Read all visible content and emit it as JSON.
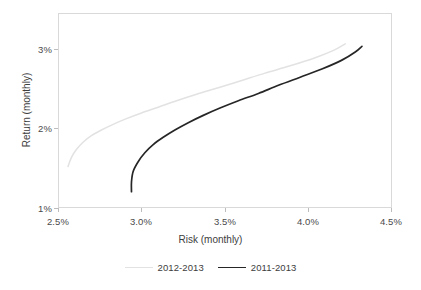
{
  "chart_data": {
    "type": "line",
    "title": "",
    "xlabel": "Risk (monthly)",
    "ylabel": "Return (monthly)",
    "xlim": [
      2.5,
      4.5
    ],
    "ylim": [
      1.0,
      3.4
    ],
    "xticks": [
      "2.5%",
      "3.0%",
      "3.5%",
      "4.0%",
      "4.5%"
    ],
    "xtick_values": [
      2.5,
      3.0,
      3.5,
      4.0,
      4.5
    ],
    "yticks": [
      "1%",
      "2%",
      "3%"
    ],
    "ytick_values": [
      1,
      2,
      3
    ],
    "grid": false,
    "legend_position": "bottom",
    "series": [
      {
        "name": "2012-2013",
        "color": "#e2e2e2",
        "points": [
          [
            2.56,
            1.51
          ],
          [
            2.58,
            1.62
          ],
          [
            2.61,
            1.72
          ],
          [
            2.65,
            1.81
          ],
          [
            2.7,
            1.89
          ],
          [
            2.76,
            1.96
          ],
          [
            2.83,
            2.03
          ],
          [
            2.91,
            2.1
          ],
          [
            3.0,
            2.17
          ],
          [
            3.1,
            2.24
          ],
          [
            3.21,
            2.32
          ],
          [
            3.33,
            2.4
          ],
          [
            3.46,
            2.48
          ],
          [
            3.6,
            2.57
          ],
          [
            3.74,
            2.66
          ],
          [
            3.89,
            2.75
          ],
          [
            4.04,
            2.85
          ],
          [
            4.15,
            2.94
          ],
          [
            4.22,
            3.02
          ]
        ]
      },
      {
        "name": "2011-2013",
        "color": "#262626",
        "points": [
          [
            2.94,
            1.2
          ],
          [
            2.94,
            1.32
          ],
          [
            2.95,
            1.45
          ],
          [
            2.98,
            1.57
          ],
          [
            3.02,
            1.68
          ],
          [
            3.07,
            1.78
          ],
          [
            3.13,
            1.87
          ],
          [
            3.2,
            1.96
          ],
          [
            3.28,
            2.05
          ],
          [
            3.37,
            2.14
          ],
          [
            3.47,
            2.23
          ],
          [
            3.58,
            2.32
          ],
          [
            3.7,
            2.41
          ],
          [
            3.82,
            2.51
          ],
          [
            3.95,
            2.61
          ],
          [
            4.08,
            2.71
          ],
          [
            4.2,
            2.82
          ],
          [
            4.28,
            2.92
          ],
          [
            4.32,
            2.99
          ]
        ]
      }
    ]
  },
  "axes": {
    "x_title": "Risk (monthly)",
    "y_title": "Return (monthly)",
    "x_tick_0": "2.5%",
    "x_tick_1": "3.0%",
    "x_tick_2": "3.5%",
    "x_tick_3": "4.0%",
    "x_tick_4": "4.5%",
    "y_tick_0": "1%",
    "y_tick_1": "2%",
    "y_tick_2": "3%"
  },
  "legend": {
    "entries": [
      {
        "label": "2012-2013",
        "color": "#e2e2e2"
      },
      {
        "label": "2011-2013",
        "color": "#262626"
      }
    ]
  },
  "colors": {
    "series_light": "#e2e2e2",
    "series_dark": "#262626",
    "frame": "#d9d9d9",
    "text": "#3d3d3d",
    "background": "#ffffff"
  }
}
